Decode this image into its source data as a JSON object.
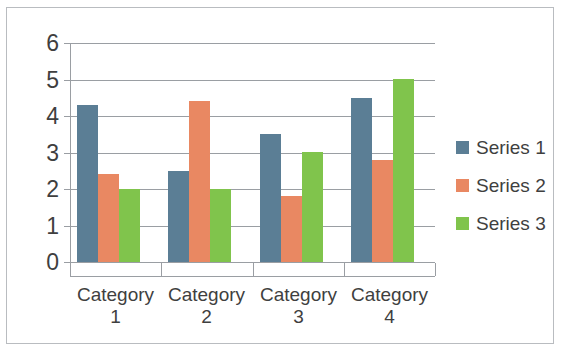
{
  "chart_data": {
    "type": "bar",
    "title": "",
    "subtitle": "",
    "xlabel": "",
    "ylabel": "",
    "categories": [
      "Category 1",
      "Category 2",
      "Category 3",
      "Category 4"
    ],
    "category_lines": [
      [
        "Category",
        "1"
      ],
      [
        "Category",
        "2"
      ],
      [
        "Category",
        "3"
      ],
      [
        "Category",
        "4"
      ]
    ],
    "series": [
      {
        "name": "Series 1",
        "color": "#5b7e95",
        "values": [
          4.3,
          2.5,
          3.5,
          4.5
        ]
      },
      {
        "name": "Series 2",
        "color": "#e98862",
        "values": [
          2.4,
          4.4,
          1.8,
          2.8
        ]
      },
      {
        "name": "Series 3",
        "color": "#80c44c",
        "values": [
          2.0,
          2.0,
          3.0,
          5.0
        ]
      }
    ],
    "ylim": [
      0,
      6
    ],
    "y_ticks": [
      0,
      1,
      2,
      3,
      4,
      5,
      6
    ],
    "y_tick_labels": [
      "0",
      "1",
      "2",
      "3",
      "4",
      "5",
      "6"
    ],
    "grid": true,
    "grid_axis": "y",
    "legend": true,
    "legend_position": "right",
    "gridline_color": "#9a9ea3",
    "axis_color": "#9a9ea3",
    "text_color": "#3f3f3f",
    "background_color": "#ffffff",
    "border_color": "#b9bcc0"
  },
  "legend": {
    "items": [
      {
        "label": "Series 1"
      },
      {
        "label": "Series 2"
      },
      {
        "label": "Series 3"
      }
    ]
  }
}
